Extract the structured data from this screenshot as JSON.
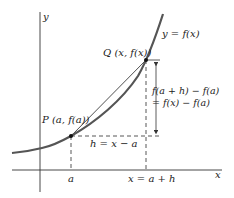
{
  "diagram": {
    "colors": {
      "axis": "#333333",
      "curve": "#555555",
      "secant": "#222222",
      "dashed": "#444444",
      "point": "#111111",
      "text": "#222222"
    },
    "axes": {
      "x_label": "x",
      "y_label": "y"
    },
    "curve": {
      "label": "y = f(x)"
    },
    "points": [
      {
        "id": "P",
        "label": "P (a, f(a))"
      },
      {
        "id": "Q",
        "label": "Q (x, f(x))"
      }
    ],
    "ticks": {
      "a": "a",
      "x_eq": "x = a + h"
    },
    "horizontal_gap": {
      "label": "h = x − a"
    },
    "vertical_gap": {
      "line1": "f(a + h) − f(a)",
      "line2": "= f(x) − f(a)"
    }
  }
}
